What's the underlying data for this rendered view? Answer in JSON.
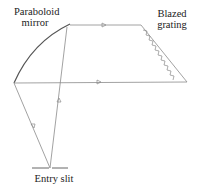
{
  "labels": {
    "mirror_line1": "Paraboloid",
    "mirror_line2": "mirror",
    "grating_line1": "Blazed",
    "grating_line2": "grating",
    "slit": "Entry slit"
  },
  "colors": {
    "line": "#8a8a8a",
    "mirror": "#555555",
    "text": "#222222"
  },
  "components": [
    "Entry slit",
    "Paraboloid mirror",
    "Blazed grating"
  ],
  "rays": [
    {
      "from": "Entry slit",
      "to": "Paraboloid mirror",
      "direction": "up"
    },
    {
      "from": "Paraboloid mirror",
      "to": "Blazed grating",
      "direction": "right"
    },
    {
      "from": "Blazed grating",
      "to": "Paraboloid mirror",
      "direction": "right-bottom"
    },
    {
      "from": "Paraboloid mirror",
      "to": "Entry slit",
      "direction": "down"
    }
  ]
}
